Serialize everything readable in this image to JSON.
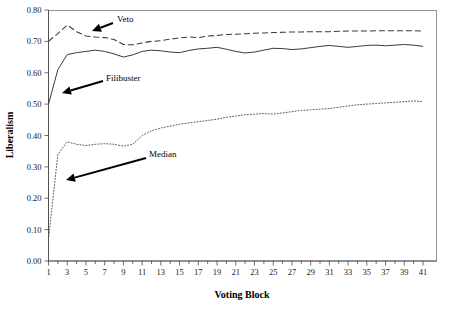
{
  "chart_data": {
    "type": "line",
    "title": "",
    "xlabel": "Voting Block",
    "ylabel": "Liberalism",
    "xlim": [
      1,
      41
    ],
    "ylim": [
      0.0,
      0.8
    ],
    "grid": false,
    "legend_position": "inline-annotations",
    "x": [
      1,
      2,
      3,
      4,
      5,
      6,
      7,
      8,
      9,
      10,
      11,
      12,
      13,
      14,
      15,
      16,
      17,
      18,
      19,
      20,
      21,
      22,
      23,
      24,
      25,
      26,
      27,
      28,
      29,
      30,
      31,
      32,
      33,
      34,
      35,
      36,
      37,
      38,
      39,
      40,
      41
    ],
    "xtick_labels": [
      "1",
      "3",
      "5",
      "7",
      "9",
      "11",
      "13",
      "15",
      "17",
      "19",
      "21",
      "23",
      "25",
      "27",
      "29",
      "31",
      "33",
      "35",
      "37",
      "39",
      "41"
    ],
    "ytick_labels": [
      "0.00",
      "0.10",
      "0.20",
      "0.30",
      "0.40",
      "0.50",
      "0.60",
      "0.70",
      "0.80"
    ],
    "ytick_values": [
      0.0,
      0.1,
      0.2,
      0.3,
      0.4,
      0.5,
      0.6,
      0.7,
      0.8
    ],
    "series": [
      {
        "name": "Veto",
        "style": "dashed",
        "color": "#3a3a3a",
        "values": [
          0.7,
          0.725,
          0.752,
          0.731,
          0.717,
          0.714,
          0.712,
          0.706,
          0.69,
          0.689,
          0.695,
          0.7,
          0.702,
          0.707,
          0.711,
          0.714,
          0.712,
          0.717,
          0.719,
          0.722,
          0.723,
          0.724,
          0.726,
          0.727,
          0.728,
          0.729,
          0.73,
          0.73,
          0.731,
          0.731,
          0.731,
          0.732,
          0.733,
          0.733,
          0.733,
          0.734,
          0.734,
          0.734,
          0.734,
          0.734,
          0.733
        ]
      },
      {
        "name": "Filibuster",
        "style": "solid",
        "color": "#3a3a3a",
        "values": [
          0.5,
          0.61,
          0.658,
          0.664,
          0.668,
          0.672,
          0.668,
          0.66,
          0.65,
          0.657,
          0.668,
          0.672,
          0.67,
          0.666,
          0.664,
          0.671,
          0.676,
          0.678,
          0.681,
          0.675,
          0.668,
          0.663,
          0.666,
          0.672,
          0.678,
          0.677,
          0.674,
          0.676,
          0.68,
          0.684,
          0.687,
          0.684,
          0.681,
          0.684,
          0.687,
          0.688,
          0.686,
          0.688,
          0.69,
          0.688,
          0.684
        ]
      },
      {
        "name": "Median",
        "style": "dotted",
        "color": "#5a5a5a",
        "values": [
          0.07,
          0.34,
          0.38,
          0.372,
          0.368,
          0.372,
          0.374,
          0.372,
          0.366,
          0.372,
          0.4,
          0.415,
          0.424,
          0.43,
          0.436,
          0.44,
          0.444,
          0.448,
          0.452,
          0.458,
          0.462,
          0.466,
          0.468,
          0.47,
          0.468,
          0.472,
          0.476,
          0.48,
          0.482,
          0.484,
          0.486,
          0.49,
          0.494,
          0.498,
          0.5,
          0.502,
          0.504,
          0.506,
          0.508,
          0.51,
          0.508
        ]
      }
    ],
    "annotations": [
      {
        "name": "veto-label",
        "text": "Veto",
        "label_x": 117,
        "label_y": 22,
        "arrow_from_x": 113,
        "arrow_from_y": 23,
        "arrow_to_x": 92,
        "arrow_to_y": 31
      },
      {
        "name": "filibuster-label",
        "text": "Filibuster",
        "label_x": 106,
        "label_y": 81,
        "arrow_from_x": 103,
        "arrow_from_y": 81,
        "arrow_to_x": 62,
        "arrow_to_y": 93
      },
      {
        "name": "median-label",
        "text": "Median",
        "label_x": 149,
        "label_y": 157,
        "arrow_from_x": 146,
        "arrow_from_y": 158,
        "arrow_to_x": 66,
        "arrow_to_y": 180
      }
    ]
  }
}
